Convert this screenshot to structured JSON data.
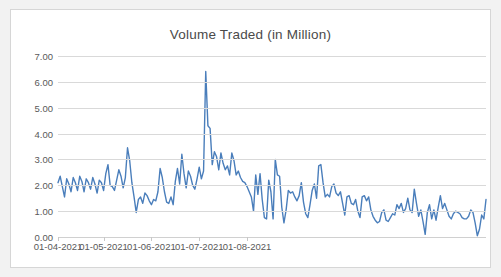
{
  "chart_data": {
    "type": "line",
    "title": "Volume Traded (in Million)",
    "xlabel": "",
    "ylabel": "",
    "ylim": [
      0,
      7
    ],
    "ytick_step": 1,
    "ytick_labels": [
      "0.00",
      "1.00",
      "2.00",
      "3.00",
      "4.00",
      "5.00",
      "6.00",
      "7.00"
    ],
    "ytick_values": [
      0,
      1,
      2,
      3,
      4,
      5,
      6,
      7
    ],
    "xtick_labels": [
      "01-04-2021",
      "01-05-2021",
      "01-06-2021",
      "01-07-2021",
      "01-08-2021"
    ],
    "xtick_indices": [
      0,
      21,
      43,
      65,
      87
    ],
    "grid": true,
    "legend": "none",
    "line_color": "#4A7EBB",
    "line_width": 1.4,
    "markers": false,
    "series": [
      {
        "name": "Volume Traded",
        "values": [
          2.1,
          2.35,
          1.95,
          1.55,
          2.25,
          2.05,
          1.75,
          2.3,
          2.1,
          1.8,
          2.35,
          2.15,
          1.75,
          2.25,
          2.1,
          1.85,
          2.3,
          2.05,
          1.7,
          2.2,
          2.1,
          1.8,
          2.45,
          2.8,
          2.0,
          1.95,
          1.8,
          2.2,
          2.6,
          2.35,
          1.9,
          2.3,
          3.45,
          2.95,
          2.1,
          1.55,
          0.95,
          1.45,
          1.55,
          1.3,
          1.7,
          1.6,
          1.4,
          1.25,
          1.45,
          1.4,
          1.75,
          2.65,
          2.3,
          1.75,
          1.35,
          1.3,
          1.55,
          1.25,
          2.15,
          2.65,
          2.05,
          3.2,
          2.45,
          1.9,
          2.55,
          2.35,
          2.0,
          1.85,
          2.25,
          2.7,
          2.25,
          2.55,
          6.4,
          4.3,
          4.2,
          2.8,
          3.3,
          3.1,
          2.6,
          3.25,
          2.85,
          2.6,
          2.75,
          2.4,
          3.25,
          2.95,
          2.4,
          2.55,
          2.3,
          2.15,
          2.1,
          1.95,
          1.75,
          1.55,
          1.0,
          2.4,
          1.65,
          2.45,
          1.45,
          0.75,
          0.7,
          2.2,
          1.75,
          0.7,
          3.0,
          2.4,
          2.35,
          1.15,
          0.55,
          1.05,
          1.8,
          1.7,
          1.75,
          1.55,
          1.4,
          1.6,
          2.1,
          1.35,
          0.9,
          0.75,
          1.25,
          1.8,
          2.05,
          1.5,
          2.75,
          2.8,
          2.1,
          1.55,
          1.65,
          1.55,
          1.95,
          2.05,
          1.7,
          1.6,
          1.75,
          1.3,
          0.85,
          1.55,
          1.6,
          1.3,
          1.25,
          1.45,
          1.0,
          0.75,
          1.55,
          1.6,
          1.4,
          1.55,
          1.05,
          0.8,
          0.65,
          0.55,
          0.6,
          0.95,
          1.05,
          0.65,
          0.6,
          0.75,
          0.9,
          0.85,
          1.25,
          1.1,
          1.3,
          0.95,
          1.1,
          1.5,
          1.05,
          0.95,
          1.85,
          1.3,
          0.8,
          1.05,
          0.6,
          0.1,
          0.95,
          1.25,
          0.7,
          1.05,
          0.65,
          1.15,
          1.6,
          1.1,
          1.3,
          1.05,
          0.8,
          0.7,
          0.9,
          1.0,
          0.95,
          0.9,
          0.75,
          0.7,
          0.7,
          0.8,
          1.05,
          0.95,
          0.55,
          0.05,
          0.3,
          0.85,
          0.7,
          1.45
        ]
      }
    ]
  }
}
